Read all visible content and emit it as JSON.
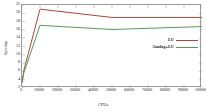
{
  "chart_data": {
    "type": "line",
    "title": "",
    "xlabel": "CPUs",
    "ylabel": "Speedup",
    "xlim": [
      0,
      100000
    ],
    "ylim": [
      2,
      22
    ],
    "grid": false,
    "legend_position": "center-right",
    "xticks": [
      "0",
      "10000",
      "20000",
      "30000",
      "40000",
      "50000",
      "60000",
      "70000",
      "80000",
      "90000",
      "100000"
    ],
    "xtick_values": [
      0,
      10000,
      20000,
      30000,
      40000,
      50000,
      60000,
      70000,
      80000,
      90000,
      100000
    ],
    "yticks": [
      "2",
      "4",
      "6",
      "8",
      "10",
      "12",
      "14",
      "16",
      "18",
      "20",
      "22"
    ],
    "ytick_values": [
      2,
      4,
      6,
      8,
      10,
      12,
      14,
      16,
      18,
      20,
      22
    ],
    "series": [
      {
        "name": "LU",
        "color": "#b5423c",
        "x": [
          0,
          1000,
          10000,
          50000,
          100000
        ],
        "values": [
          3.2,
          6.2,
          21.0,
          19.0,
          19.0
        ]
      },
      {
        "name": "Analog+LU",
        "color": "#4f9f56",
        "x": [
          0,
          1000,
          10000,
          50000,
          100000
        ],
        "values": [
          3.2,
          5.6,
          17.1,
          16.1,
          16.8
        ]
      }
    ]
  },
  "legend": {
    "entries": [
      {
        "label": "LU",
        "color": "#b5423c"
      },
      {
        "label": "Analog+LU",
        "color": "#4f9f56"
      }
    ]
  },
  "axis_titles": {
    "x": "CPUs",
    "y": "Speedup"
  }
}
